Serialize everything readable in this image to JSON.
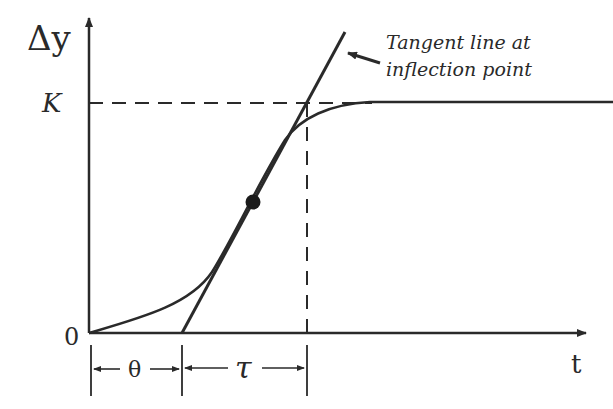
{
  "labels": {
    "y_axis": "Δy",
    "x_axis": "t",
    "k_level": "K",
    "origin": "0",
    "annotation_line1": "Tangent line at",
    "annotation_line2": "inflection point",
    "dead_time": "θ",
    "time_constant": "τ"
  },
  "colors": {
    "ink": "#2a2a2a",
    "background": "#ffffff"
  },
  "geometry": {
    "origin": [
      89,
      333
    ],
    "y_axis_top": 14,
    "x_axis_right": 588,
    "k_y": 103,
    "theta_x": 182,
    "tau_end_x": 307,
    "inflection_point": [
      253,
      202
    ],
    "tangent_top": [
      345,
      32
    ]
  }
}
